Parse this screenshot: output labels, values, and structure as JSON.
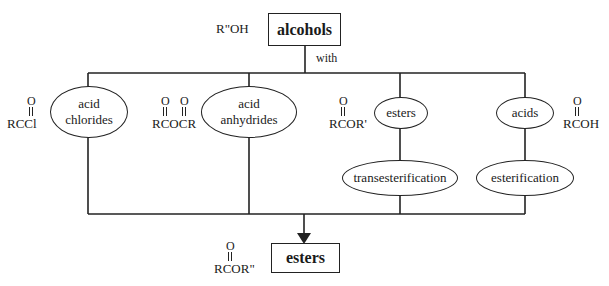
{
  "source": {
    "label": "alcohols",
    "formula": "R\"OH",
    "connector_label": "with"
  },
  "reagents": [
    {
      "label_lines": [
        "acid",
        "chlorides"
      ],
      "formula": "RCCl"
    },
    {
      "label_lines": [
        "acid",
        "anhydrides"
      ],
      "formula": "RCOCR"
    },
    {
      "label_lines": [
        "esters"
      ],
      "formula": "RCOR'",
      "process": "transesterification"
    },
    {
      "label_lines": [
        "acids"
      ],
      "formula": "RCOH",
      "process": "esterification"
    }
  ],
  "product": {
    "label": "esters",
    "formula": "RCOR\""
  },
  "carbonyl_oxygen": "O",
  "colors": {
    "line": "#222222",
    "background": "#ffffff"
  }
}
